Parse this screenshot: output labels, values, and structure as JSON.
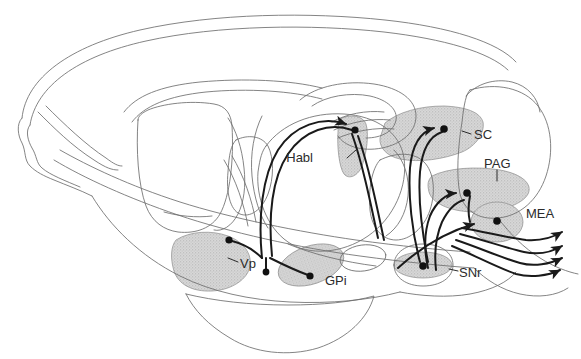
{
  "figure": {
    "kind": "sagittal-brain-schematic",
    "title_text": "",
    "background_color": "#ffffff",
    "outline_color": "#5a5a5a",
    "shade_color": "#d0d0d0",
    "arrow_color": "#1a1a1a"
  },
  "labels": {
    "habl": "Habl",
    "sc": "SC",
    "pag": "PAG",
    "mea": "MEA",
    "snr": "SNr",
    "vp": "Vp",
    "gpi": "GPi"
  },
  "regions": [
    {
      "id": "habl",
      "label": "Habl",
      "shaded": true
    },
    {
      "id": "sc",
      "label": "SC",
      "shaded": true
    },
    {
      "id": "pag",
      "label": "PAG",
      "shaded": true
    },
    {
      "id": "mea",
      "label": "MEA",
      "shaded": true
    },
    {
      "id": "snr",
      "label": "SNr",
      "shaded": true
    },
    {
      "id": "vp",
      "label": "Vp",
      "shaded": true
    },
    {
      "id": "gpi",
      "label": "GPi",
      "shaded": true
    }
  ],
  "projections": [
    {
      "from": "GPi-area",
      "to": "Habl",
      "terminal": "dot-arrow"
    },
    {
      "from": "pallidum",
      "to": "Vp",
      "terminal": "dot"
    },
    {
      "from": "pallidum",
      "to": "GPi",
      "terminal": "dot"
    },
    {
      "from": "SNr",
      "to": "SC",
      "terminal": "dot-arrow"
    },
    {
      "from": "SNr",
      "to": "PAG",
      "terminal": "dot-arrow"
    },
    {
      "from": "SNr",
      "to": "MEA",
      "terminal": "dot-arrow"
    },
    {
      "from": "MEA",
      "to": "caudal-brainstem-1",
      "terminal": "arrow"
    },
    {
      "from": "MEA",
      "to": "caudal-brainstem-2",
      "terminal": "arrow"
    },
    {
      "from": "MEA",
      "to": "caudal-brainstem-3",
      "terminal": "arrow"
    },
    {
      "from": "MEA",
      "to": "caudal-brainstem-4",
      "terminal": "arrow"
    }
  ]
}
